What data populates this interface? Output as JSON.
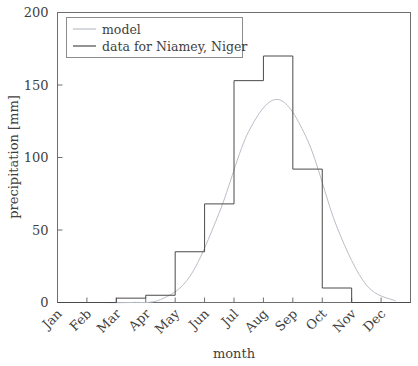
{
  "chart_data": {
    "type": "bar",
    "title": "",
    "xlabel": "month",
    "ylabel": "precipitation [mm]",
    "categories": [
      "Jan",
      "Feb",
      "Mar",
      "Apr",
      "May",
      "Jun",
      "Jul",
      "Aug",
      "Sep",
      "Oct",
      "Nov",
      "Dec"
    ],
    "ylim": [
      0,
      200
    ],
    "yticks": [
      0,
      50,
      100,
      150,
      200
    ],
    "ytick_labels": [
      "0",
      "50",
      "100",
      "150",
      "200"
    ],
    "xtick_labels": [
      "Jan",
      "Feb",
      "Mar",
      "Apr",
      "May",
      "Jun",
      "Jul",
      "Aug",
      "Sep",
      "Oct",
      "Nov",
      "Dec"
    ],
    "grid": false,
    "legend_position": "upper left",
    "series": [
      {
        "name": "data for Niamey, Niger",
        "style": "step",
        "color": "#4a4a4a",
        "values": [
          0,
          0,
          3,
          5,
          35,
          68,
          153,
          170,
          92,
          10,
          0,
          0
        ]
      },
      {
        "name": "model",
        "style": "line",
        "color": "#b9bec7",
        "values": [
          0,
          0,
          0,
          2,
          18,
          62,
          118,
          140,
          112,
          52,
          12,
          1
        ]
      }
    ],
    "legend": [
      {
        "label": "model",
        "color": "#b9bec7"
      },
      {
        "label": "data for Niamey, Niger",
        "color": "#4a4a4a"
      }
    ]
  }
}
